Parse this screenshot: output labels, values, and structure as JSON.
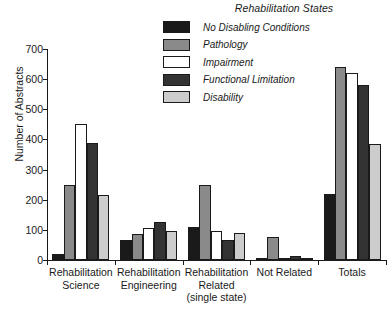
{
  "legend": {
    "title": "Rehabilitation States",
    "entries": [
      {
        "label": "No Disabling Conditions",
        "color": "#1a1a1a",
        "icon": "legend-swatch-black"
      },
      {
        "label": "Pathology",
        "color": "#8a8a8a",
        "icon": "legend-swatch-gray"
      },
      {
        "label": "Impairment",
        "color": "#ffffff",
        "icon": "legend-swatch-white"
      },
      {
        "label": "Functional Limitation",
        "color": "#333333",
        "icon": "legend-swatch-darkgray"
      },
      {
        "label": "Disability",
        "color": "#cccccc",
        "icon": "legend-swatch-lightgray"
      }
    ]
  },
  "chart_data": {
    "type": "bar",
    "title": "",
    "xlabel": "",
    "ylabel": "Number of Abstracts",
    "ylim": [
      0,
      700
    ],
    "yticks": [
      0,
      100,
      200,
      300,
      400,
      500,
      600,
      700
    ],
    "ytick_labels": [
      "0",
      "100",
      "200",
      "300",
      "400",
      "500",
      "600",
      "700"
    ],
    "grid": false,
    "legend_position": "top-right",
    "legend_title": "Rehabilitation States",
    "categories": [
      "Rehabilitation Science",
      "Rehabilitation Engineering",
      "Rehabilitation Related (single state)",
      "Not Related",
      "Totals"
    ],
    "category_lines": [
      [
        "Rehabilitation",
        "Science"
      ],
      [
        "Rehabilitation",
        "Engineering"
      ],
      [
        "Rehabilitation",
        "Related",
        "(single state)"
      ],
      [
        "Not Related"
      ],
      [
        "Totals"
      ]
    ],
    "series": [
      {
        "name": "No Disabling Conditions",
        "color": "#1a1a1a",
        "values": [
          20,
          65,
          110,
          3,
          220
        ]
      },
      {
        "name": "Pathology",
        "color": "#8a8a8a",
        "values": [
          250,
          85,
          250,
          75,
          640
        ]
      },
      {
        "name": "Impairment",
        "color": "#ffffff",
        "values": [
          450,
          105,
          95,
          2,
          620
        ]
      },
      {
        "name": "Functional Limitation",
        "color": "#333333",
        "values": [
          388,
          125,
          65,
          12,
          580
        ]
      },
      {
        "name": "Disability",
        "color": "#cccccc",
        "values": [
          215,
          95,
          90,
          3,
          385
        ]
      }
    ]
  }
}
